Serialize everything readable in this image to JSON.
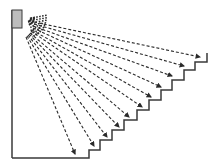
{
  "diagram": {
    "colors": {
      "line": "#3a3a3a",
      "box_fill": "#bdbdbd",
      "arrow": "#2a2a2a"
    },
    "emitter": {
      "box": {
        "x": 12,
        "y": 10,
        "w": 10,
        "h": 18
      },
      "origin": [
        27,
        18
      ]
    },
    "wall": {
      "x": 12,
      "y1": 10,
      "y2": 158
    },
    "staircase": [
      [
        12,
        158
      ],
      [
        89,
        158
      ],
      [
        89,
        150
      ],
      [
        100,
        150
      ],
      [
        100,
        140
      ],
      [
        112,
        140
      ],
      [
        112,
        130
      ],
      [
        124,
        130
      ],
      [
        124,
        120
      ],
      [
        137,
        120
      ],
      [
        137,
        110
      ],
      [
        149,
        110
      ],
      [
        149,
        100
      ],
      [
        161,
        100
      ],
      [
        161,
        90
      ],
      [
        172,
        90
      ],
      [
        172,
        80
      ],
      [
        184,
        80
      ],
      [
        184,
        70
      ],
      [
        195,
        70
      ],
      [
        195,
        62
      ],
      [
        207,
        62
      ],
      [
        207,
        53
      ]
    ],
    "rays": [
      {
        "from": [
          34,
          22
        ],
        "to": [
          200,
          57
        ]
      },
      {
        "from": [
          34,
          24
        ],
        "to": [
          184,
          66
        ]
      },
      {
        "from": [
          33,
          26
        ],
        "to": [
          172,
          76
        ]
      },
      {
        "from": [
          33,
          28
        ],
        "to": [
          161,
          87
        ]
      },
      {
        "from": [
          32,
          30
        ],
        "to": [
          151,
          97
        ]
      },
      {
        "from": [
          31,
          31
        ],
        "to": [
          142,
          107
        ]
      },
      {
        "from": [
          30,
          33
        ],
        "to": [
          129,
          117
        ]
      },
      {
        "from": [
          29,
          34
        ],
        "to": [
          119,
          127
        ]
      },
      {
        "from": [
          28,
          35
        ],
        "to": [
          107,
          137
        ]
      },
      {
        "from": [
          27,
          36
        ],
        "to": [
          94,
          146
        ]
      },
      {
        "from": [
          26,
          37
        ],
        "to": [
          75,
          154
        ]
      }
    ]
  }
}
